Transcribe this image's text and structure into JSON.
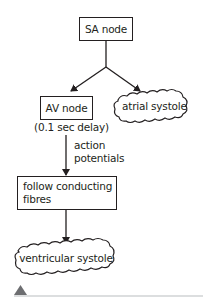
{
  "diagram": {
    "nodes": {
      "sa_node": {
        "label": "SA node",
        "shape": "rectangle"
      },
      "av_node": {
        "label": "AV node",
        "shape": "rectangle"
      },
      "av_delay": {
        "label": "(0.1 sec delay)"
      },
      "atrial_systole": {
        "label": "atrial systole",
        "shape": "cloud"
      },
      "action_potentials": {
        "line1": "action",
        "line2": "potentials"
      },
      "conducting_fibres": {
        "line1": "follow conducting",
        "line2": "fibres",
        "shape": "rectangle"
      },
      "ventricular_systole": {
        "label": "ventricular systole",
        "shape": "cloud"
      }
    },
    "edges": [
      {
        "from": "SA node",
        "to": "AV node"
      },
      {
        "from": "SA node",
        "to": "atrial systole"
      },
      {
        "from": "AV node",
        "to": "follow conducting fibres",
        "label": "action potentials"
      },
      {
        "from": "follow conducting fibres",
        "to": "ventricular systole"
      }
    ],
    "colors": {
      "stroke": "#231f20",
      "footer_triangle": "#6d6e71",
      "footer_rule": "#d1d3d4"
    }
  }
}
